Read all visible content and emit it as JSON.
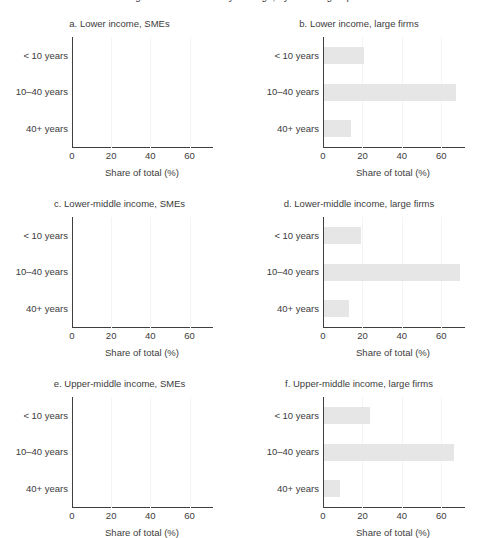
{
  "figure": {
    "suptitle": "Figure. Share of total by firm age, by income group",
    "xlabel": "Share of total (%)",
    "bar_color": "#e6e6e6",
    "axis_color": "#3f3f3f",
    "text_color": "#3c3c3c",
    "categories": [
      "< 10 years",
      "10–40 years",
      "40+ years"
    ],
    "xticks": [
      "0",
      "20",
      "40",
      "60"
    ],
    "xtick_values": [
      0,
      20,
      40,
      60
    ]
  },
  "chart_data": [
    {
      "type": "bar",
      "panel": "a",
      "title": "a. Lower income, SMEs",
      "orientation": "horizontal",
      "categories": [
        "< 10 years",
        "10–40 years",
        "40+ years"
      ],
      "values": [
        0,
        0,
        0
      ],
      "xlabel": "Share of total (%)",
      "ylabel": "",
      "xlim": [
        0,
        72
      ],
      "grid": true,
      "legend": false
    },
    {
      "type": "bar",
      "panel": "b",
      "title": "b. Lower income, large firms",
      "orientation": "horizontal",
      "categories": [
        "< 10 years",
        "10–40 years",
        "40+ years"
      ],
      "values": [
        20.5,
        67,
        13.5
      ],
      "xlabel": "Share of total (%)",
      "ylabel": "",
      "xlim": [
        0,
        72
      ],
      "grid": true,
      "legend": false
    },
    {
      "type": "bar",
      "panel": "c",
      "title": "c. Lower-middle income, SMEs",
      "orientation": "horizontal",
      "categories": [
        "< 10 years",
        "10–40 years",
        "40+ years"
      ],
      "values": [
        0,
        0,
        0
      ],
      "xlabel": "Share of total (%)",
      "ylabel": "",
      "xlim": [
        0,
        72
      ],
      "grid": true,
      "legend": false
    },
    {
      "type": "bar",
      "panel": "d",
      "title": "d. Lower-middle income, large firms",
      "orientation": "horizontal",
      "categories": [
        "< 10 years",
        "10–40 years",
        "40+ years"
      ],
      "values": [
        19,
        69,
        12.5
      ],
      "xlabel": "Share of total (%)",
      "ylabel": "",
      "xlim": [
        0,
        72
      ],
      "grid": true,
      "legend": false
    },
    {
      "type": "bar",
      "panel": "e",
      "title": "e. Upper-middle income, SMEs",
      "orientation": "horizontal",
      "categories": [
        "< 10 years",
        "10–40 years",
        "40+ years"
      ],
      "values": [
        0,
        0,
        0
      ],
      "xlabel": "Share of total (%)",
      "ylabel": "",
      "xlim": [
        0,
        72
      ],
      "grid": true,
      "legend": false
    },
    {
      "type": "bar",
      "panel": "f",
      "title": "f. Upper-middle income, large firms",
      "orientation": "horizontal",
      "categories": [
        "< 10 years",
        "10–40 years",
        "40+ years"
      ],
      "values": [
        23.5,
        66,
        8
      ],
      "xlabel": "Share of total (%)",
      "ylabel": "",
      "xlim": [
        0,
        72
      ],
      "grid": true,
      "legend": false
    }
  ]
}
